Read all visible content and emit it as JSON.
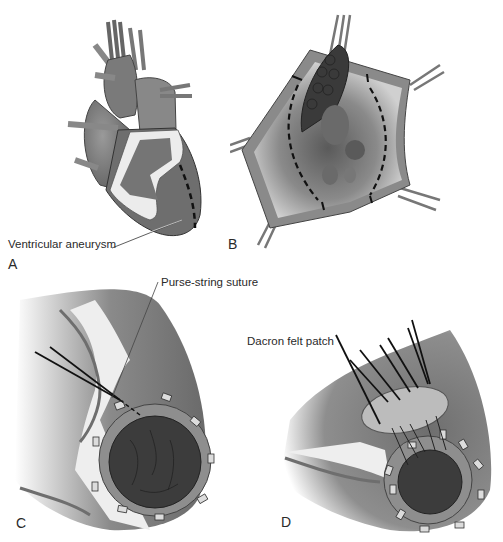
{
  "figure": {
    "panels": [
      {
        "id": "A",
        "letter": "A",
        "callout": "Ventricular aneurysm"
      },
      {
        "id": "B",
        "letter": "B"
      },
      {
        "id": "C",
        "letter": "C",
        "callout": "Purse-string suture"
      },
      {
        "id": "D",
        "letter": "D",
        "callout": "Dacron felt patch"
      }
    ]
  },
  "colors": {
    "tissue_dark": "#6a6a6a",
    "tissue_mid": "#8c8c8c",
    "tissue_light": "#c8c8c8",
    "fat_pale": "#ececec",
    "thrombus": "#3a3a3a",
    "patch": "#b9b9b9",
    "outline": "#2b2b2b"
  }
}
